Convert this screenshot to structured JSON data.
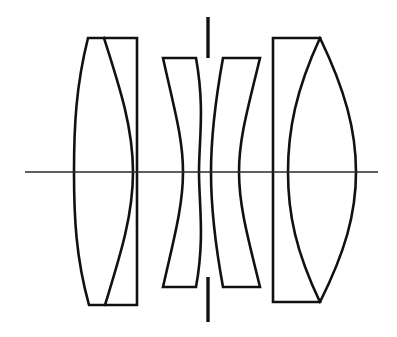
{
  "figure": {
    "kind": "optical-lens-cross-section",
    "background_color": "#ffffff",
    "ink_color": "#111111",
    "axis_color": "#2a2a2a",
    "width": 397,
    "height": 337
  },
  "optical_axis": {
    "name": "optical-axis",
    "y": 172,
    "x_start": 25,
    "x_end": 378,
    "stroke_width": 1.5
  },
  "aperture_stop": {
    "name": "aperture-stop",
    "x": 208,
    "upper_bar": {
      "y_top": 17,
      "y_bottom": 58
    },
    "lower_bar": {
      "y_top": 277,
      "y_bottom": 322
    },
    "stroke_width": 3.4
  },
  "groups": [
    {
      "name": "front-cemented-doublet",
      "label": "Front group",
      "element_count": 2,
      "x_left": 75,
      "x_right": 137,
      "y_top": 38,
      "y_bottom": 305,
      "front_vertex_x": 110,
      "cement_vertex_x": 133,
      "elements": [
        {
          "name": "front-biconvex-element",
          "shape": "biconvex",
          "front_surface": "convex",
          "rear_surface": "convex"
        },
        {
          "name": "front-plano-concave-element",
          "shape": "plano-concave",
          "front_surface": "concave",
          "rear_surface": "flat"
        }
      ]
    },
    {
      "name": "middle-left-meniscus",
      "label": "Second element",
      "element_count": 1,
      "x_left_top": 163,
      "x_right_top": 196,
      "y_top": 58,
      "y_bottom": 287,
      "waist_front_x": 183,
      "waist_rear_x": 199,
      "elements": [
        {
          "name": "left-negative-meniscus-element",
          "shape": "negative-meniscus",
          "front_surface": "convex",
          "rear_surface": "concave"
        }
      ]
    },
    {
      "name": "middle-right-meniscus",
      "label": "Third element",
      "element_count": 1,
      "x_left_top": 223,
      "x_right_top": 260,
      "y_top": 58,
      "y_bottom": 287,
      "waist_front_x": 211,
      "waist_rear_x": 226,
      "elements": [
        {
          "name": "right-negative-meniscus-element",
          "shape": "negative-meniscus",
          "front_surface": "concave",
          "rear_surface": "convex"
        }
      ]
    },
    {
      "name": "rear-cemented-doublet",
      "label": "Rear group",
      "element_count": 2,
      "x_left": 273,
      "x_right": 356,
      "y_top": 38,
      "y_bottom": 302,
      "cement_vertex_x": 288,
      "rear_vertex_x": 356,
      "elements": [
        {
          "name": "rear-plano-concave-element",
          "shape": "plano-concave",
          "front_surface": "flat",
          "rear_surface": "concave"
        },
        {
          "name": "rear-biconvex-element",
          "shape": "biconvex",
          "front_surface": "convex",
          "rear_surface": "convex"
        }
      ]
    }
  ]
}
